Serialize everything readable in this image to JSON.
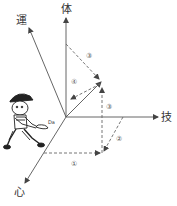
{
  "diagram": {
    "axes": [
      {
        "id": "tai",
        "label": "体"
      },
      {
        "id": "un",
        "label": "運"
      },
      {
        "id": "gi",
        "label": "技"
      },
      {
        "id": "shin",
        "label": "心"
      }
    ],
    "steps": [
      {
        "id": "step1",
        "label": "①"
      },
      {
        "id": "step2",
        "label": "②"
      },
      {
        "id": "step3a",
        "label": "③"
      },
      {
        "id": "step3b",
        "label": "③"
      },
      {
        "id": "step4",
        "label": "④"
      }
    ],
    "colors": {
      "axis": "#555555",
      "dashed": "#666666",
      "background": "#ffffff"
    }
  }
}
